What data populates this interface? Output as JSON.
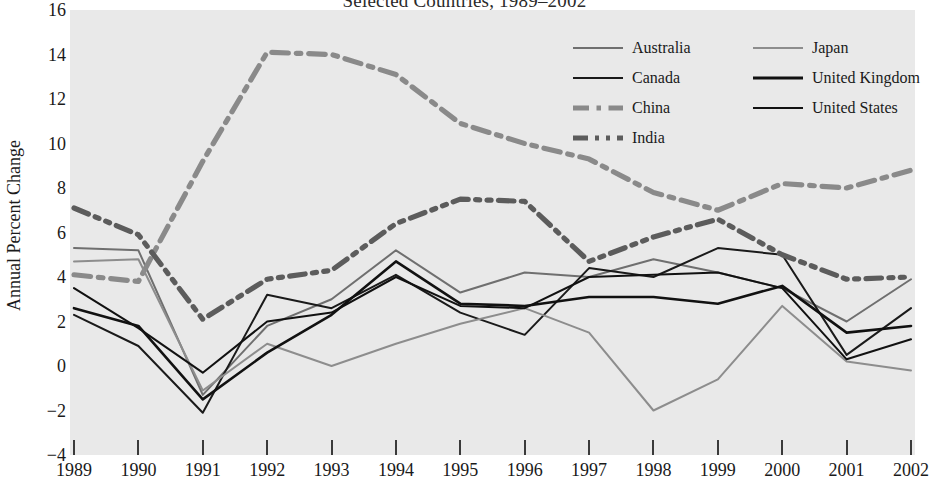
{
  "chart_title": "Selected Countries, 1989–2002",
  "axes": {
    "ylabel": "Annual Percent Change",
    "xlabel": "",
    "y_ticks": [
      16,
      14,
      12,
      10,
      8,
      6,
      4,
      2,
      0,
      -2,
      -4
    ],
    "y_tick_labels": [
      "16",
      "14",
      "12",
      "10",
      "8",
      "6",
      "4",
      "2",
      "0",
      "−2",
      "−4"
    ],
    "x_tick_labels": [
      "1989",
      "1990",
      "1991",
      "1992",
      "1993",
      "1994",
      "1995",
      "1996",
      "1997",
      "1998",
      "1999",
      "2000",
      "2001",
      "2002"
    ]
  },
  "legend": {
    "position": "top-right",
    "columns": 2,
    "entries": [
      {
        "label": "Australia",
        "color": "#6f6f6f",
        "width": 2,
        "dash": "none",
        "column": 0,
        "row": 0
      },
      {
        "label": "Canada",
        "color": "#1a1a1a",
        "width": 2,
        "dash": "none",
        "column": 0,
        "row": 1
      },
      {
        "label": "China",
        "color": "#8a8a8a",
        "width": 5,
        "dash": "dashdot",
        "column": 0,
        "row": 2
      },
      {
        "label": "India",
        "color": "#5c5c5c",
        "width": 5,
        "dash": "dashdotdot",
        "column": 0,
        "row": 3
      },
      {
        "label": "Japan",
        "color": "#8d8d8d",
        "width": 2,
        "dash": "none",
        "column": 1,
        "row": 0
      },
      {
        "label": "United Kingdom",
        "color": "#111111",
        "width": 3,
        "dash": "none",
        "column": 1,
        "row": 1
      },
      {
        "label": "United States",
        "color": "#111111",
        "width": 2,
        "dash": "none",
        "column": 1,
        "row": 2
      }
    ]
  },
  "chart_data": {
    "type": "line",
    "title": "Selected Countries, 1989–2002",
    "xlabel": "",
    "ylabel": "Annual Percent Change",
    "x": [
      1989,
      1990,
      1991,
      1992,
      1993,
      1994,
      1995,
      1996,
      1997,
      1998,
      1999,
      2000,
      2001,
      2002
    ],
    "xlim": [
      1989,
      2002
    ],
    "ylim": [
      -4,
      16
    ],
    "grid": false,
    "background": "#e9e9e9",
    "series": [
      {
        "name": "Australia",
        "color": "#6f6f6f",
        "style": "solid",
        "values": [
          5.3,
          5.2,
          -1.3,
          1.8,
          3.0,
          5.2,
          3.3,
          4.2,
          4.0,
          4.8,
          4.2,
          3.5,
          2.0,
          3.9
        ]
      },
      {
        "name": "Canada",
        "color": "#1a1a1a",
        "style": "solid",
        "values": [
          2.3,
          0.9,
          -2.1,
          3.2,
          2.6,
          4.1,
          2.4,
          1.4,
          4.4,
          4.0,
          5.3,
          5.0,
          0.5,
          2.6
        ]
      },
      {
        "name": "China",
        "color": "#8a8a8a",
        "style": "dashdot",
        "values": [
          4.1,
          3.8,
          9.2,
          14.1,
          14.0,
          13.1,
          10.9,
          10.0,
          9.3,
          7.8,
          7.0,
          8.2,
          8.0,
          8.8
        ]
      },
      {
        "name": "India",
        "color": "#5c5c5c",
        "style": "dashdotdot",
        "values": [
          7.1,
          5.9,
          2.1,
          3.9,
          4.3,
          6.4,
          7.5,
          7.4,
          4.7,
          5.8,
          6.6,
          5.0,
          3.9,
          4.0
        ]
      },
      {
        "name": "Japan",
        "color": "#8d8d8d",
        "style": "solid",
        "values": [
          4.7,
          4.8,
          -1.1,
          1.0,
          0.0,
          1.0,
          1.9,
          2.6,
          1.5,
          -2.0,
          -0.6,
          2.7,
          0.2,
          -0.2
        ]
      },
      {
        "name": "United Kingdom",
        "color": "#111111",
        "style": "solid",
        "values": [
          2.6,
          1.8,
          -1.5,
          0.6,
          2.3,
          4.7,
          2.8,
          2.7,
          3.1,
          3.1,
          2.8,
          3.6,
          1.5,
          1.8
        ]
      },
      {
        "name": "United States",
        "color": "#111111",
        "style": "solid",
        "values": [
          3.5,
          1.7,
          -0.3,
          2.0,
          2.4,
          4.0,
          2.7,
          2.6,
          4.0,
          4.1,
          4.2,
          3.5,
          0.3,
          1.2
        ]
      }
    ]
  }
}
